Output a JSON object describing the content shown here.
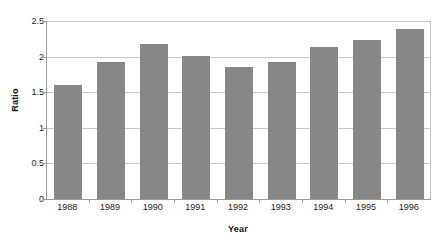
{
  "chart_data": {
    "type": "bar",
    "title": "",
    "xlabel": "Year",
    "ylabel": "Ratio",
    "categories": [
      "1988",
      "1989",
      "1990",
      "1991",
      "1992",
      "1993",
      "1994",
      "1995",
      "1996"
    ],
    "values": [
      1.6,
      1.92,
      2.18,
      2.01,
      1.85,
      1.92,
      2.14,
      2.23,
      2.39
    ],
    "ylim": [
      0,
      2.5
    ],
    "yticks": [
      0,
      0.5,
      1,
      1.5,
      2,
      2.5
    ],
    "ytick_labels": [
      "0",
      "0.5",
      "1",
      "1.5",
      "2",
      "2.5"
    ],
    "grid": "horizontal",
    "legend": "none",
    "series": [
      {
        "name": "Ratio",
        "color": "#878787",
        "values": [
          1.6,
          1.92,
          2.18,
          2.01,
          1.85,
          1.92,
          2.14,
          2.23,
          2.39
        ]
      }
    ],
    "colors": {
      "bar": "#878787",
      "gridline": "#c9c9c9",
      "axis": "#9a9a9a",
      "background": "#ffffff",
      "text": "#1a1a1a"
    }
  }
}
